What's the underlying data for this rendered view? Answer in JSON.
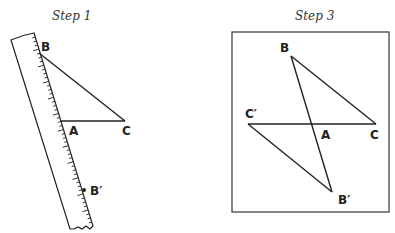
{
  "panels": [
    {
      "title": "Step 1",
      "points": {
        "B": "B",
        "A": "A",
        "C": "C",
        "B_prime": "B′"
      },
      "objects": [
        "ruler",
        "triangle ABC"
      ]
    },
    {
      "title": "Step 3",
      "points": {
        "B": "B",
        "A": "A",
        "C": "C",
        "C_prime": "C′",
        "B_prime": "B′"
      },
      "objects": [
        "framed box",
        "triangle ABC",
        "triangle AB′C′"
      ]
    }
  ]
}
